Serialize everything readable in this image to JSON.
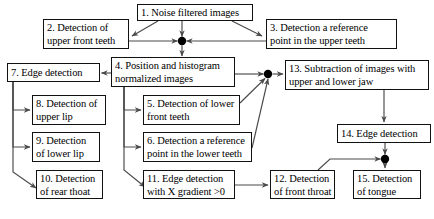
{
  "diagram": {
    "background_color": "#ffffff",
    "line_color": "#4a4a4a",
    "text_color": "#000000",
    "box_border_color": "#111111",
    "junction_color": "#000000",
    "nodes": [
      {
        "id": "n1",
        "number": "1.",
        "label": "1. Noise filtered images",
        "x": 137,
        "y": 4,
        "w": 116,
        "h": 17,
        "lines": 1
      },
      {
        "id": "n2",
        "number": "2.",
        "label": "2. Detection of\nupper front teeth",
        "x": 43,
        "y": 19,
        "w": 86,
        "h": 30,
        "lines": 2
      },
      {
        "id": "n3",
        "number": "3.",
        "label": "3. Detection a reference\npoint in the upper teeth",
        "x": 266,
        "y": 19,
        "w": 131,
        "h": 30,
        "lines": 2
      },
      {
        "id": "n4",
        "number": "4.",
        "label": "4. Position and histogram\nnormalized images",
        "x": 111,
        "y": 57,
        "w": 124,
        "h": 30,
        "lines": 2
      },
      {
        "id": "n7",
        "number": "7.",
        "label": "7. Edge detection",
        "x": 7,
        "y": 63,
        "w": 93,
        "h": 19,
        "lines": 1
      },
      {
        "id": "n13",
        "number": "13.",
        "label": "13. Subtraction of images with\nupper and lower jaw",
        "x": 285,
        "y": 60,
        "w": 144,
        "h": 30,
        "lines": 2
      },
      {
        "id": "n8",
        "number": "8.",
        "label": "8. Detection of\nupper lip",
        "x": 32,
        "y": 95,
        "w": 74,
        "h": 30,
        "lines": 2
      },
      {
        "id": "n5",
        "number": "5.",
        "label": "5. Detection of lower\nfront teeth",
        "x": 143,
        "y": 95,
        "w": 97,
        "h": 30,
        "lines": 2
      },
      {
        "id": "n14",
        "number": "14.",
        "label": "14. Edge detection",
        "x": 337,
        "y": 124,
        "w": 94,
        "h": 19,
        "lines": 1
      },
      {
        "id": "n9",
        "number": "9.",
        "label": "9. Detection\nof lower lip",
        "x": 32,
        "y": 132,
        "w": 68,
        "h": 30,
        "lines": 2
      },
      {
        "id": "n6",
        "number": "6.",
        "label": "6. Detection a reference\npoint in the lower teeth",
        "x": 143,
        "y": 132,
        "w": 109,
        "h": 30,
        "lines": 2
      },
      {
        "id": "n10",
        "number": "10.",
        "label": "10. Detection\nof rear thoat",
        "x": 36,
        "y": 170,
        "w": 67,
        "h": 29,
        "lines": 2
      },
      {
        "id": "n11",
        "number": "11.",
        "label": "11. Edge detection\nwith X gradient >0",
        "x": 143,
        "y": 170,
        "w": 92,
        "h": 29,
        "lines": 2
      },
      {
        "id": "n12",
        "number": "12.",
        "label": "12. Detection\nof front throat",
        "x": 270,
        "y": 170,
        "w": 65,
        "h": 29,
        "lines": 2
      },
      {
        "id": "n15",
        "number": "15.",
        "label": "15. Detection\nof tongue",
        "x": 353,
        "y": 170,
        "w": 68,
        "h": 29,
        "lines": 2
      }
    ],
    "junctions": [
      {
        "id": "j1",
        "x": 182,
        "y": 41,
        "r": 4.2,
        "name": "junction-top-center"
      },
      {
        "id": "j2",
        "x": 268,
        "y": 74,
        "r": 4.2,
        "name": "junction-right-middle"
      },
      {
        "id": "j3",
        "x": 385,
        "y": 159,
        "r": 4.2,
        "name": "junction-bottom-right"
      }
    ],
    "edges": [
      {
        "from": "n1",
        "to": "n2",
        "name": "edge-1-to-2"
      },
      {
        "from": "n1",
        "to": "n3",
        "name": "edge-1-to-3"
      },
      {
        "from": "n1",
        "to": "j1",
        "name": "edge-1-to-junction-top"
      },
      {
        "from": "n2",
        "to": "j1",
        "name": "edge-2-to-junction-top"
      },
      {
        "from": "n3",
        "to": "j1",
        "name": "edge-3-to-junction-top"
      },
      {
        "from": "j1",
        "to": "n4",
        "name": "edge-junction-top-to-4"
      },
      {
        "from": "n4",
        "to": "n7",
        "name": "edge-4-to-7"
      },
      {
        "from": "n4",
        "to": "j2",
        "name": "edge-4-to-junction-right"
      },
      {
        "from": "n4",
        "to": "n5",
        "name": "edge-4-to-5"
      },
      {
        "from": "n4",
        "to": "n6",
        "name": "edge-4-to-6"
      },
      {
        "from": "n4",
        "to": "n11",
        "name": "edge-4-to-11"
      },
      {
        "from": "n7",
        "to": "n8",
        "name": "edge-7-to-8"
      },
      {
        "from": "n7",
        "to": "n9",
        "name": "edge-7-to-9"
      },
      {
        "from": "n7",
        "to": "n10",
        "name": "edge-7-to-10"
      },
      {
        "from": "n5",
        "to": "j2",
        "name": "edge-5-to-junction-right"
      },
      {
        "from": "n6",
        "to": "j2",
        "name": "edge-6-to-junction-right"
      },
      {
        "from": "j2",
        "to": "n13",
        "name": "edge-junction-right-to-13"
      },
      {
        "from": "n13",
        "to": "n14",
        "name": "edge-13-to-14"
      },
      {
        "from": "n14",
        "to": "j3",
        "name": "edge-14-to-junction-bottom"
      },
      {
        "from": "n11",
        "to": "n12",
        "name": "edge-11-to-12"
      },
      {
        "from": "n12",
        "to": "j3",
        "name": "edge-12-to-junction-bottom"
      },
      {
        "from": "j3",
        "to": "n15",
        "name": "edge-junction-bottom-to-15"
      }
    ]
  }
}
